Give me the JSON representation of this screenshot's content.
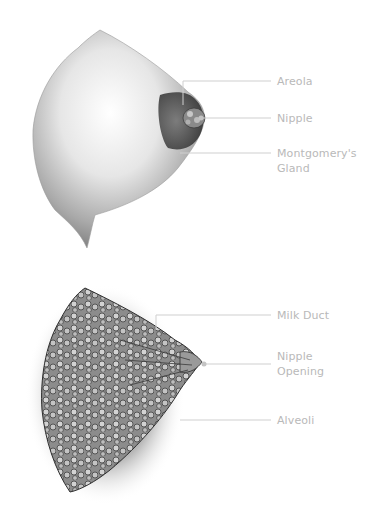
{
  "figures": [
    {
      "name": "external-view",
      "labels": [
        {
          "id": "areola",
          "text": "Areola"
        },
        {
          "id": "nipple",
          "text": "Nipple"
        },
        {
          "id": "montgomery",
          "text": "Montgomery's",
          "text2": "Gland"
        }
      ]
    },
    {
      "name": "internal-view",
      "labels": [
        {
          "id": "milk-duct",
          "text": "Milk Duct"
        },
        {
          "id": "nipple-opening",
          "text": "Nipple",
          "text2": "Opening"
        },
        {
          "id": "alveoli",
          "text": "Alveoli"
        }
      ]
    }
  ],
  "colors": {
    "label": "#b9b9b9",
    "leader": "#cfcfcf",
    "ink": "#3a3a3a"
  }
}
